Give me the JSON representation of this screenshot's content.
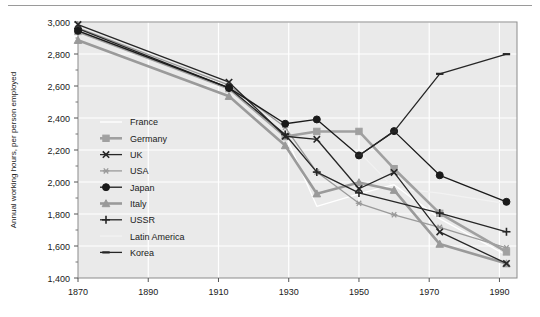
{
  "chart_data": {
    "type": "line",
    "title": "",
    "subtitle": "",
    "xlabel": "",
    "ylabel": "Annual working hours, per person employed",
    "xlim": [
      1870,
      1995
    ],
    "ylim": [
      1400,
      3000
    ],
    "xticks": [
      "1870",
      "1890",
      "1910",
      "1930",
      "1950",
      "1970",
      "1990"
    ],
    "xtick_values": [
      1870,
      1890,
      1910,
      1930,
      1950,
      1970,
      1990
    ],
    "yticks": [
      "1,400",
      "1,600",
      "1,800",
      "2,000",
      "2,200",
      "2,400",
      "2,600",
      "2,800",
      "3,000"
    ],
    "ytick_values": [
      1400,
      1600,
      1800,
      2000,
      2200,
      2400,
      2600,
      2800,
      3000
    ],
    "grid": true,
    "legend_position": "inside-left",
    "plot_bg": "#eaeaea",
    "series": [
      {
        "name": "France",
        "color": "#ffffff",
        "marker": "none",
        "x": [
          1870,
          1913,
          1929,
          1938,
          1950,
          1960,
          1973,
          1992
        ],
        "values": [
          2945,
          2588,
          2297,
          1848,
          1926,
          1983,
          1771,
          1542
        ]
      },
      {
        "name": "Germany",
        "color": "#a0a0a0",
        "marker": "square",
        "x": [
          1870,
          1913,
          1929,
          1938,
          1950,
          1960,
          1973,
          1992
        ],
        "values": [
          2941,
          2584,
          2284,
          2316,
          2316,
          2083,
          1804,
          1563
        ]
      },
      {
        "name": "UK",
        "color": "#262626",
        "marker": "x",
        "x": [
          1870,
          1913,
          1929,
          1938,
          1950,
          1960,
          1973,
          1992
        ],
        "values": [
          2984,
          2624,
          2286,
          2267,
          1958,
          2060,
          1688,
          1491
        ]
      },
      {
        "name": "USA",
        "color": "#9a9a9a",
        "marker": "asterisk",
        "x": [
          1870,
          1913,
          1929,
          1938,
          1950,
          1960,
          1973,
          1992
        ],
        "values": [
          2964,
          2605,
          2342,
          2062,
          1867,
          1795,
          1717,
          1589
        ]
      },
      {
        "name": "Japan",
        "color": "#1a1a1a",
        "marker": "circle",
        "x": [
          1870,
          1913,
          1929,
          1938,
          1950,
          1960,
          1973,
          1992
        ],
        "values": [
          2945,
          2588,
          2364,
          2391,
          2166,
          2318,
          2042,
          1876
        ]
      },
      {
        "name": "Italy",
        "color": "#9a9a9a",
        "marker": "triangle",
        "x": [
          1870,
          1913,
          1929,
          1938,
          1950,
          1960,
          1973,
          1992
        ],
        "values": [
          2886,
          2536,
          2228,
          1927,
          1997,
          1949,
          1612,
          1490
        ]
      },
      {
        "name": "USSR",
        "color": "#262626",
        "marker": "plus",
        "x": [
          1870,
          1913,
          1929,
          1938,
          1950,
          1973,
          1992
        ],
        "values": [
          2958,
          2588,
          2297,
          2062,
          1932,
          1806,
          1689
        ]
      },
      {
        "name": "Latin America",
        "color": "#f2f2f2",
        "marker": "none",
        "x": [
          1950,
          1960,
          1973,
          1992
        ],
        "values": [
          2188,
          1963,
          1930,
          1865
        ]
      },
      {
        "name": "Korea",
        "color": "#262626",
        "marker": "dash",
        "x": [
          1950,
          1960,
          1973,
          1992
        ],
        "values": [
          2166,
          2316,
          2676,
          2799
        ]
      }
    ]
  },
  "legend": {
    "items": [
      {
        "label": "France"
      },
      {
        "label": "Germany"
      },
      {
        "label": "UK"
      },
      {
        "label": "USA"
      },
      {
        "label": "Japan"
      },
      {
        "label": "Italy"
      },
      {
        "label": "USSR"
      },
      {
        "label": "Latin America"
      },
      {
        "label": "Korea"
      }
    ]
  }
}
